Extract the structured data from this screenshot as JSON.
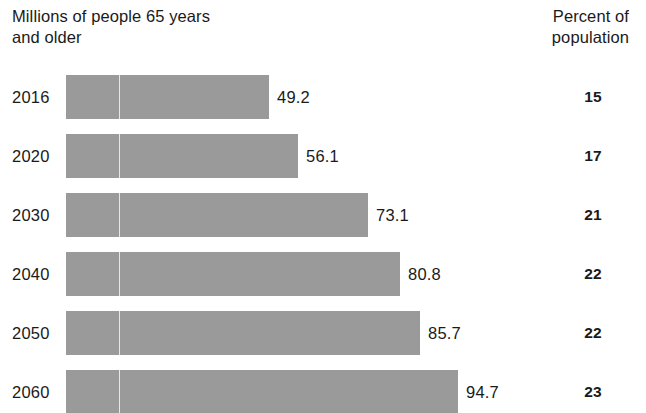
{
  "header": {
    "left_title": "Millions of people 65 years\nand older",
    "right_title": "Percent of\npopulation"
  },
  "chart_data": {
    "type": "bar",
    "orientation": "horizontal",
    "title": "Millions of people 65 years and older",
    "xlabel": "",
    "ylabel": "",
    "categories": [
      "2016",
      "2020",
      "2030",
      "2040",
      "2050",
      "2060"
    ],
    "values": [
      49.2,
      56.1,
      73.1,
      80.8,
      85.7,
      94.7
    ],
    "value_labels": [
      "49.2",
      "56.1",
      "73.1",
      "80.8",
      "85.7",
      "94.7"
    ],
    "series": [
      {
        "name": "Millions of people 65 years and older",
        "values": [
          49.2,
          56.1,
          73.1,
          80.8,
          85.7,
          94.7
        ]
      },
      {
        "name": "Percent of population",
        "values": [
          15,
          17,
          21,
          22,
          22,
          23
        ]
      }
    ],
    "secondary_column": {
      "header": "Percent of population",
      "labels": [
        "15",
        "17",
        "21",
        "22",
        "22",
        "23"
      ]
    },
    "xlim": [
      0,
      100
    ],
    "grid": false,
    "legend": "none",
    "bar_color": "#9a9a9a",
    "background_color": "#ffffff",
    "text_color": "#1a1a1a"
  },
  "rows": [
    {
      "year": "2016",
      "value": "49.2",
      "percent": "15"
    },
    {
      "year": "2020",
      "value": "56.1",
      "percent": "17"
    },
    {
      "year": "2030",
      "value": "73.1",
      "percent": "21"
    },
    {
      "year": "2040",
      "value": "80.8",
      "percent": "22"
    },
    {
      "year": "2050",
      "value": "85.7",
      "percent": "22"
    },
    {
      "year": "2060",
      "value": "94.7",
      "percent": "23"
    }
  ]
}
